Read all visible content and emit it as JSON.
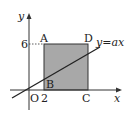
{
  "diagram": {
    "axes": {
      "x_label": "x",
      "y_label": "y",
      "origin_label": "O"
    },
    "ticks": {
      "x_tick": "2",
      "y_tick": "6"
    },
    "points": {
      "A": "A",
      "B": "B",
      "C": "C",
      "D": "D"
    },
    "line_label": "y=ax",
    "colors": {
      "fill": "#a8a8a8",
      "stroke": "#222222",
      "axis": "#333333"
    }
  }
}
